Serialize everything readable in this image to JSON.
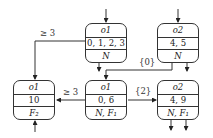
{
  "diagram": {
    "nodes": [
      {
        "id": "n1",
        "name": "o1",
        "values": "0, 1, 2, 3",
        "flags": "N"
      },
      {
        "id": "n2",
        "name": "o2",
        "values": "4, 5",
        "flags": "N"
      },
      {
        "id": "n3",
        "name": "o1",
        "values": "10",
        "flags": "F₂"
      },
      {
        "id": "n4",
        "name": "o1",
        "values": "0, 6",
        "flags": "N, F₁"
      },
      {
        "id": "n5",
        "name": "o2",
        "values": "4, 9",
        "flags": "N, F₁"
      }
    ],
    "edges": [
      {
        "from": "n1",
        "to": "n3",
        "label": "≥ 3"
      },
      {
        "from": "n2",
        "to": "n4",
        "label": "{0}"
      },
      {
        "from": "n4",
        "to": "n3",
        "label": "≥ 3"
      },
      {
        "from": "n4",
        "to": "n5",
        "label": "{2}"
      }
    ]
  }
}
